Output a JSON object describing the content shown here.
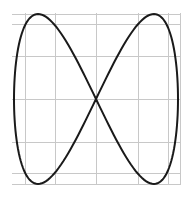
{
  "chart_data": {
    "type": "line",
    "title": "",
    "xlabel": "",
    "ylabel": "",
    "parametric": {
      "x": "sin(t)",
      "y": "sin(2t)",
      "t_range": [
        0,
        6.2832
      ],
      "samples": 200
    },
    "xlim": [
      -1,
      1
    ],
    "ylim": [
      -1,
      1
    ],
    "grid": true,
    "legend": null,
    "series": [
      {
        "name": "curve",
        "x": [
          0,
          0.383,
          0.707,
          0.924,
          1,
          0.924,
          0.707,
          0.383,
          0,
          -0.383,
          -0.707,
          -0.924,
          -1,
          -0.924,
          -0.707,
          -0.383,
          0
        ],
        "y": [
          0,
          0.707,
          1,
          0.707,
          0,
          -0.707,
          -1,
          -0.707,
          0,
          0.707,
          1,
          0.707,
          0,
          -0.707,
          -1,
          -0.707,
          0
        ]
      }
    ],
    "layout": {
      "center_px": [
        96,
        99
      ],
      "radius_px": [
        82,
        85
      ],
      "grid_x_px": [
        25,
        55,
        96,
        138,
        168,
        180
      ],
      "grid_y_px": [
        14,
        24,
        56,
        99,
        142,
        173,
        184
      ],
      "grid_extent_px": {
        "x0": 12,
        "x1": 181,
        "y0": 13,
        "y1": 185
      }
    },
    "colors": {
      "curve": "#1a1a1a",
      "grid": "#c8c8c8",
      "background": "#ffffff"
    }
  }
}
